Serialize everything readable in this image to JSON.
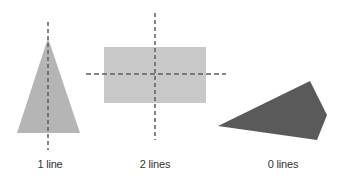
{
  "colors": {
    "triangle_fill": "#b5b5b5",
    "rectangle_fill": "#c8c8c8",
    "quad_fill": "#5a5a5a",
    "dash_line": "#5e5e5e"
  },
  "shapes": [
    {
      "name": "isosceles-triangle",
      "symmetry_lines": 1,
      "label": "1 line"
    },
    {
      "name": "rectangle",
      "symmetry_lines": 2,
      "label": "2 lines"
    },
    {
      "name": "irregular-quadrilateral",
      "symmetry_lines": 0,
      "label": "0 lines"
    }
  ]
}
